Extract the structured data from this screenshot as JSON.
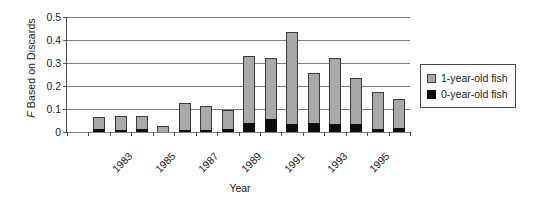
{
  "chart_data": {
    "type": "bar",
    "subtype": "stacked",
    "title": "",
    "xlabel": "Year",
    "ylabel": "F Based on Discards",
    "ylabel_italic_prefix": "F",
    "ylabel_rest": " Based on Discards",
    "ylim": [
      0,
      0.5
    ],
    "yticks": [
      "0",
      "0.1",
      "0.2",
      "0.3",
      "0.4",
      "0.5"
    ],
    "ytick_values": [
      0,
      0.1,
      0.2,
      0.3,
      0.4,
      0.5
    ],
    "grid": "horizontal",
    "legend_position": "right",
    "categories": [
      "1982",
      "1983",
      "1984",
      "1985",
      "1986",
      "1987",
      "1988",
      "1989",
      "1990",
      "1991",
      "1992",
      "1993",
      "1994",
      "1995",
      "1996",
      "1997"
    ],
    "xtick_labels_shown": [
      "1983",
      "1985",
      "1987",
      "1989",
      "1991",
      "1993",
      "1995"
    ],
    "series": [
      {
        "name": "0-year-old fish",
        "color": "#0d0d0d",
        "values": [
          0,
          0.012,
          0.008,
          0.013,
          0,
          0.01,
          0.008,
          0.014,
          0.038,
          0.058,
          0.035,
          0.041,
          0.035,
          0.037,
          0.014,
          0.018
        ]
      },
      {
        "name": "1-year-old fish",
        "color": "#a9a9a9",
        "values": [
          0,
          0.052,
          0.063,
          0.058,
          0.025,
          0.118,
          0.103,
          0.083,
          0.291,
          0.266,
          0.4,
          0.214,
          0.288,
          0.198,
          0.162,
          0.127
        ]
      }
    ],
    "totals": [
      0,
      0.064,
      0.071,
      0.071,
      0.025,
      0.128,
      0.111,
      0.097,
      0.329,
      0.324,
      0.435,
      0.255,
      0.323,
      0.235,
      0.176,
      0.145
    ]
  },
  "legend": {
    "items": [
      {
        "label": "1-year-old fish",
        "swatch": "gray"
      },
      {
        "label": "0-year-old fish",
        "swatch": "black"
      }
    ]
  }
}
